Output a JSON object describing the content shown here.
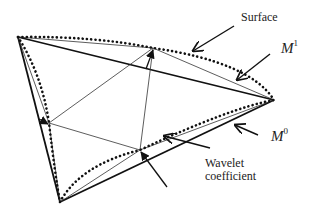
{
  "diagram": {
    "type": "mesh-subdivision-wavelet",
    "labels": {
      "surface": "Surface",
      "m1_base": "M",
      "m1_sup": "1",
      "m0_base": "M",
      "m0_sup": "0",
      "wavelet_line1": "Wavelet",
      "wavelet_line2": "coefficient"
    },
    "vertices": {
      "A": [
        18,
        37
      ],
      "B": [
        274,
        100
      ],
      "C": [
        60,
        202
      ]
    },
    "midpoints_on_surface": {
      "AB": [
        153,
        48
      ],
      "AC": [
        49,
        123
      ],
      "BC": [
        140,
        150
      ]
    },
    "colors": {
      "stroke": "#111111",
      "text": "#222222",
      "background": "#ffffff"
    }
  }
}
